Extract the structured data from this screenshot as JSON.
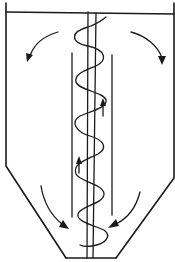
{
  "diagram": {
    "title": "",
    "colors": {
      "line": "#1a1a1a",
      "background": "#ffffff"
    },
    "components": [
      {
        "id": "vessel-wall",
        "label": ""
      },
      {
        "id": "vessel-lid",
        "label": ""
      },
      {
        "id": "conical-bottom",
        "label": ""
      },
      {
        "id": "screw-shaft",
        "label": ""
      },
      {
        "id": "helical-flight",
        "label": ""
      },
      {
        "id": "lift-tube",
        "label": ""
      }
    ],
    "flow_arrows": [
      {
        "id": "top-left-outward",
        "direction": "down-left"
      },
      {
        "id": "top-right-outward",
        "direction": "down-right"
      },
      {
        "id": "tube-upward-upper",
        "direction": "up"
      },
      {
        "id": "tube-upward-lower",
        "direction": "up"
      },
      {
        "id": "cone-left-inward",
        "direction": "down-right"
      },
      {
        "id": "cone-right-inward",
        "direction": "down-left"
      }
    ]
  }
}
